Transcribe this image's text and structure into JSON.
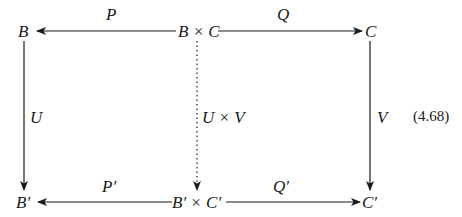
{
  "diagram": {
    "type": "commutative-diagram",
    "equation_number": "(4.68)",
    "nodes": {
      "top_left": "B",
      "top_middle": "B × C",
      "top_right": "C",
      "bottom_left": "B′",
      "bottom_middle": "B′ × C′",
      "bottom_right": "C′"
    },
    "arrows": {
      "top_left_arrow": {
        "label": "P",
        "from": "B × C",
        "to": "B",
        "style": "solid"
      },
      "top_right_arrow": {
        "label": "Q",
        "from": "B × C",
        "to": "C",
        "style": "solid"
      },
      "left_vertical": {
        "label": "U",
        "from": "B",
        "to": "B′",
        "style": "solid"
      },
      "middle_vertical": {
        "label": "U × V",
        "from": "B × C",
        "to": "B′ × C′",
        "style": "dotted"
      },
      "right_vertical": {
        "label": "V",
        "from": "C",
        "to": "C′",
        "style": "solid"
      },
      "bottom_left_arrow": {
        "label": "P′",
        "from": "B′ × C′",
        "to": "B′",
        "style": "solid"
      },
      "bottom_right_arrow": {
        "label": "Q′",
        "from": "B′ × C′",
        "to": "C′",
        "style": "solid"
      }
    },
    "colors": {
      "ink": "#1a1a1a",
      "background": "#ffffff"
    }
  }
}
